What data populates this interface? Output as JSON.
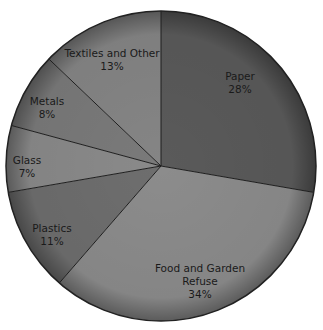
{
  "chart_data": {
    "type": "pie",
    "title": "",
    "start_angle_deg": -90,
    "direction": "clockwise",
    "center": [
      161,
      166
    ],
    "radius": 155,
    "slices": [
      {
        "label": "Paper",
        "lines": [
          "Paper",
          "28%"
        ],
        "value": 28,
        "color": "#5a5a5a",
        "label_pos": [
          240,
          80
        ]
      },
      {
        "label": "Food and Garden Refuse",
        "lines": [
          "Food and Garden",
          "Refuse",
          "34%"
        ],
        "value": 34,
        "color": "#8c8c8c",
        "label_pos": [
          200,
          272
        ]
      },
      {
        "label": "Plastics",
        "lines": [
          "Plastics",
          "11%"
        ],
        "value": 11,
        "color": "#6e6e6e",
        "label_pos": [
          52,
          232
        ]
      },
      {
        "label": "Glass",
        "lines": [
          "Glass",
          "7%"
        ],
        "value": 7,
        "color": "#8a8a8a",
        "label_pos": [
          27,
          164
        ]
      },
      {
        "label": "Metals",
        "lines": [
          "Metals",
          "8%"
        ],
        "value": 8,
        "color": "#7a7a7a",
        "label_pos": [
          47,
          105
        ]
      },
      {
        "label": "Textiles and Other",
        "lines": [
          "Textiles and Other",
          "13%"
        ],
        "value": 13,
        "color": "#858585",
        "label_pos": [
          112,
          57
        ]
      }
    ]
  }
}
